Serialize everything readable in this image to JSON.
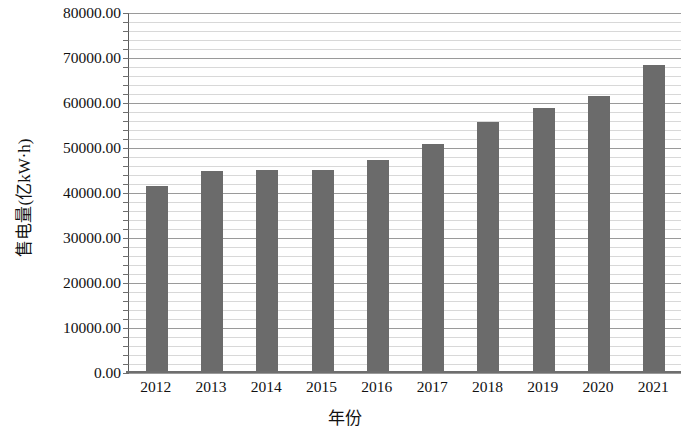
{
  "chart_data": {
    "type": "bar",
    "title": "",
    "subtitle": "",
    "xlabel": "年份",
    "ylabel": "售电量(亿kW·h)",
    "categories": [
      "2012",
      "2013",
      "2014",
      "2015",
      "2016",
      "2017",
      "2018",
      "2019",
      "2020",
      "2021"
    ],
    "values": [
      41500,
      45000,
      45100,
      45100,
      47400,
      50800,
      55800,
      59000,
      61600,
      68500
    ],
    "series": [
      {
        "name": "售电量",
        "values": [
          41500,
          45000,
          45100,
          45100,
          47400,
          50800,
          55800,
          59000,
          61600,
          68500
        ]
      }
    ],
    "ylim": [
      0,
      80000
    ],
    "y_major_step": 10000,
    "y_minor_step": 2000,
    "y_tick_labels": [
      "0.00",
      "10000.00",
      "20000.00",
      "30000.00",
      "40000.00",
      "50000.00",
      "60000.00",
      "70000.00",
      "80000.00"
    ],
    "grid": "horizontal-major-and-minor",
    "legend": "none",
    "bar_color": "#6b6b6b",
    "grid_major_color": "#9a9a9a",
    "grid_minor_color": "#d8d8d8",
    "axis_color": "#6e6e6e",
    "background_color": "#ffffff"
  }
}
